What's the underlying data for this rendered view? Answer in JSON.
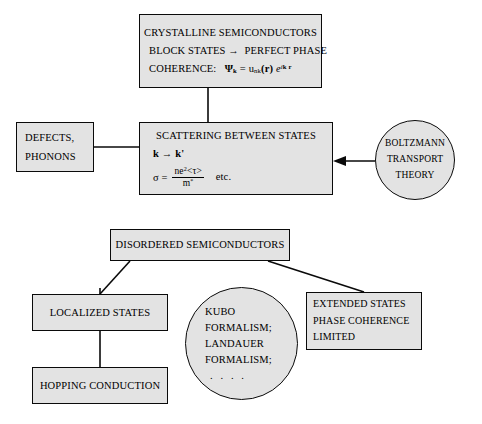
{
  "diagram": {
    "background": "#ffffff",
    "node_fill": "#e3e3e3",
    "node_stroke": "#0a0a0a",
    "nodes": {
      "crystalline": {
        "shape": "rectangle",
        "lines": [
          "CRYSTALLINE SEMICONDUCTORS",
          "BLOCK STATES",
          "PERFECT PHASE",
          "COHERENCE:"
        ],
        "arrow_glyph": "→",
        "formula_plain": "Ψk = unk(r) e^(ik·r)",
        "formula_parts": {
          "psi": "Ψ",
          "psi_sub": "k",
          "equals": "=",
          "u": "u",
          "u_sub": "nk",
          "arg": "(r)",
          "exp_base": "e",
          "exp_sup_k": "k",
          "exp_sup_r": "r",
          "exp_i": "i"
        }
      },
      "defects": {
        "shape": "rectangle",
        "lines": [
          "DEFECTS,",
          "PHONONS"
        ]
      },
      "scattering": {
        "shape": "rectangle",
        "title": "SCATTERING BETWEEN STATES",
        "transition": "k → k'",
        "transition_parts": {
          "from": "k",
          "arrow": "→",
          "to": "k'"
        },
        "formula_plain": "σ = ne²<τ> / m*   etc.",
        "formula_parts": {
          "sigma": "σ",
          "equals": "=",
          "numerator": "ne",
          "numerator_sup": "2",
          "numerator_tail": "<τ>",
          "denominator": "m",
          "denominator_sup": "*",
          "etc": "etc."
        }
      },
      "boltzmann": {
        "shape": "circle",
        "lines": [
          "BOLTZMANN",
          "TRANSPORT",
          "THEORY"
        ]
      },
      "disordered": {
        "shape": "rectangle",
        "lines": [
          "DISORDERED SEMICONDUCTORS"
        ]
      },
      "localized": {
        "shape": "rectangle",
        "lines": [
          "LOCALIZED STATES"
        ]
      },
      "kubo": {
        "shape": "circle",
        "lines": [
          "KUBO",
          "FORMALISM;",
          "LANDAUER",
          "FORMALISM;"
        ],
        "ellipsis": ". . . ."
      },
      "extended": {
        "shape": "rectangle",
        "lines": [
          "EXTENDED STATES",
          "PHASE COHERENCE",
          "LIMITED"
        ]
      },
      "hopping": {
        "shape": "rectangle",
        "lines": [
          "HOPPING CONDUCTION"
        ]
      }
    },
    "connectors": [
      {
        "name": "crystalline-to-scattering",
        "from": "crystalline",
        "to": "scattering",
        "style": "plain-line"
      },
      {
        "name": "defects-to-scattering",
        "from": "defects",
        "to": "scattering",
        "style": "plain-line"
      },
      {
        "name": "boltzmann-to-scattering",
        "from": "boltzmann",
        "to": "scattering",
        "style": "arrow"
      },
      {
        "name": "disordered-to-localized",
        "from": "disordered",
        "to": "localized",
        "style": "elbow-line"
      },
      {
        "name": "disordered-to-extended",
        "from": "disordered",
        "to": "extended",
        "style": "elbow-line"
      },
      {
        "name": "localized-to-hopping",
        "from": "localized",
        "to": "hopping",
        "style": "plain-line"
      }
    ]
  }
}
